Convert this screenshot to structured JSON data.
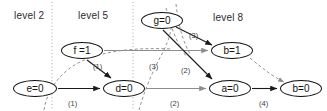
{
  "diagram": {
    "background": "#ffffff",
    "colors": {
      "node_stroke": "#111111",
      "node_fill": "#ffffff",
      "solid_edge": "#1a1a1a",
      "gray_edge": "#8d8d8d",
      "dashed_edge": "#8d8d8d",
      "divider": "#9a9a9a",
      "text": "#111111"
    },
    "levels": [
      {
        "id": "level-2",
        "label": "level 2",
        "x": 14,
        "y": 10
      },
      {
        "id": "level-5",
        "label": "level 5",
        "x": 78,
        "y": 10
      },
      {
        "id": "level-8",
        "label": "level 8",
        "x": 213,
        "y": 12
      }
    ],
    "dividers": [
      {
        "id": "divider-1",
        "x": 52
      },
      {
        "id": "divider-2",
        "x": 133
      }
    ],
    "nodes": [
      {
        "id": "node-e",
        "label": "e=0",
        "x": 13,
        "y": 80,
        "w": 44,
        "h": 17
      },
      {
        "id": "node-f",
        "label": "f =1",
        "x": 61,
        "y": 42,
        "w": 42,
        "h": 17
      },
      {
        "id": "node-d",
        "label": "d=0",
        "x": 103,
        "y": 80,
        "w": 42,
        "h": 17
      },
      {
        "id": "node-g",
        "label": "g=0",
        "x": 141,
        "y": 12,
        "w": 42,
        "h": 17
      },
      {
        "id": "node-b1",
        "label": "b=1",
        "x": 211,
        "y": 42,
        "w": 42,
        "h": 17
      },
      {
        "id": "node-a",
        "label": "a=0",
        "x": 209,
        "y": 80,
        "w": 42,
        "h": 17
      },
      {
        "id": "node-b0",
        "label": "b=0",
        "x": 280,
        "y": 80,
        "w": 42,
        "h": 17
      }
    ],
    "edge_labels": [
      {
        "id": "edge-label-e-d",
        "text": "(1)",
        "x": 68,
        "y": 99
      },
      {
        "id": "edge-label-f-d",
        "text": "(1)",
        "x": 93,
        "y": 62
      },
      {
        "id": "edge-label-d-a",
        "text": "(2)",
        "x": 170,
        "y": 99
      },
      {
        "id": "edge-label-g-b1",
        "text": "(3)",
        "x": 189,
        "y": 31
      },
      {
        "id": "edge-label-dash",
        "text": "(3)",
        "x": 149,
        "y": 62
      },
      {
        "id": "edge-label-g-a",
        "text": "(2)",
        "x": 181,
        "y": 66
      },
      {
        "id": "edge-label-a-b0",
        "text": "(4)",
        "x": 259,
        "y": 99
      }
    ]
  }
}
